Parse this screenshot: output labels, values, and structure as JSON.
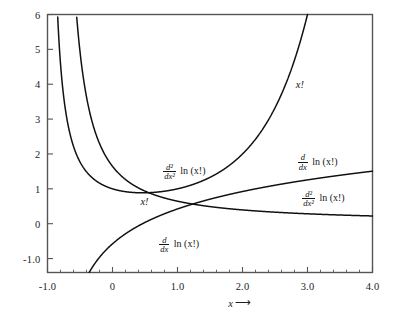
{
  "chart_data": {
    "type": "line",
    "title": "",
    "xlabel": "x",
    "ylabel": "",
    "xlim": [
      -1.0,
      4.0
    ],
    "ylim": [
      -1.4,
      6.0
    ],
    "grid": false,
    "legend_position": "inline-curve-labels",
    "x_ticks": [
      {
        "value": -1.0,
        "label": "-1.0"
      },
      {
        "value": 0.0,
        "label": "0"
      },
      {
        "value": 1.0,
        "label": "1.0"
      },
      {
        "value": 2.0,
        "label": "2.0"
      },
      {
        "value": 3.0,
        "label": "3.0"
      },
      {
        "value": 4.0,
        "label": "4.0"
      }
    ],
    "x_minor_ticks": [
      -0.8,
      -0.6,
      -0.4,
      -0.2,
      0.2,
      0.4,
      0.6,
      0.8,
      1.2,
      1.4,
      1.6,
      1.8,
      2.2,
      2.4,
      2.6,
      2.8,
      3.2,
      3.4,
      3.6,
      3.8
    ],
    "y_ticks": [
      {
        "value": 6,
        "label": "6"
      },
      {
        "value": 5,
        "label": "5"
      },
      {
        "value": 4,
        "label": "4"
      },
      {
        "value": 3,
        "label": "3"
      },
      {
        "value": 2,
        "label": "2"
      },
      {
        "value": 1,
        "label": "1"
      },
      {
        "value": 0,
        "label": "0"
      },
      {
        "value": -1.0,
        "label": "-1.0"
      }
    ],
    "series": [
      {
        "name": "x!",
        "function": "gamma(x+1)",
        "label": "x!",
        "points": [
          [
            -0.98,
            49.0
          ],
          [
            -0.95,
            19.5
          ],
          [
            -0.92,
            12.1
          ],
          [
            -0.9,
            9.51
          ],
          [
            -0.88,
            7.86
          ],
          [
            -0.86,
            6.69
          ],
          [
            -0.84,
            5.81
          ],
          [
            -0.82,
            5.13
          ],
          [
            -0.8,
            4.59
          ],
          [
            -0.78,
            4.15
          ],
          [
            -0.76,
            3.78
          ],
          [
            -0.74,
            3.47
          ],
          [
            -0.7,
            2.98
          ],
          [
            -0.65,
            2.53
          ],
          [
            -0.6,
            2.22
          ],
          [
            -0.55,
            1.98
          ],
          [
            -0.5,
            1.77
          ],
          [
            -0.45,
            1.62
          ],
          [
            -0.4,
            1.49
          ],
          [
            -0.35,
            1.38
          ],
          [
            -0.3,
            1.3
          ],
          [
            -0.25,
            1.23
          ],
          [
            -0.2,
            1.16
          ],
          [
            -0.15,
            1.11
          ],
          [
            -0.1,
            1.07
          ],
          [
            -0.05,
            1.03
          ],
          [
            0.0,
            1.0
          ],
          [
            0.1,
            0.951
          ],
          [
            0.2,
            0.918
          ],
          [
            0.3,
            0.898
          ],
          [
            0.4616,
            0.8856
          ],
          [
            0.6,
            0.894
          ],
          [
            0.8,
            0.931
          ],
          [
            1.0,
            1.0
          ],
          [
            1.2,
            1.102
          ],
          [
            1.4,
            1.242
          ],
          [
            1.6,
            1.429
          ],
          [
            1.8,
            1.676
          ],
          [
            2.0,
            2.0
          ],
          [
            2.2,
            2.424
          ],
          [
            2.4,
            2.981
          ],
          [
            2.6,
            3.717
          ],
          [
            2.8,
            4.694
          ],
          [
            3.0,
            6.0
          ]
        ]
      },
      {
        "name": "d/dx ln (x!)",
        "function": "digamma(x+1)",
        "label_left": "d/dx ln (x!)",
        "label_right": "d/dx ln (x!)",
        "points": [
          [
            -0.4,
            -1.4
          ],
          [
            -0.35,
            -1.0
          ],
          [
            -0.3,
            -0.695
          ],
          [
            -0.25,
            -0.455
          ],
          [
            -0.2,
            -0.258
          ],
          [
            -0.15,
            -0.094
          ],
          [
            -0.1,
            0.046
          ],
          [
            -0.05,
            0.166
          ],
          [
            0.0,
            0.2704
          ],
          [
            0.2,
            0.5838
          ],
          [
            0.4,
            0.7874
          ],
          [
            0.6,
            0.931
          ],
          [
            0.8,
            1.0391
          ],
          [
            1.0,
            1.1246
          ],
          [
            1.3,
            1.2222
          ],
          [
            1.6,
            1.3039
          ],
          [
            2.0,
            1.3956
          ],
          [
            2.5,
            1.4914
          ],
          [
            3.0,
            1.5689
          ],
          [
            3.5,
            1.6338
          ],
          [
            4.0,
            1.6895
          ]
        ]
      },
      {
        "name": "d2/dx2 ln (x!)",
        "function": "trigamma(x+1)",
        "label_left": "d²/dx² ln (x!)",
        "label_right": "d²/dx² ln (x!)",
        "points": [
          [
            -0.56,
            6.0
          ],
          [
            -0.5,
            4.93
          ],
          [
            -0.45,
            4.24
          ],
          [
            -0.4,
            3.7
          ],
          [
            -0.35,
            3.27
          ],
          [
            -0.3,
            2.92
          ],
          [
            -0.25,
            2.62
          ],
          [
            -0.2,
            2.37
          ],
          [
            -0.15,
            2.15
          ],
          [
            -0.1,
            1.97
          ],
          [
            -0.05,
            1.8
          ],
          [
            0.0,
            1.6449
          ],
          [
            0.2,
            1.2671
          ],
          [
            0.4,
            1.0256
          ],
          [
            0.6,
            0.8639
          ],
          [
            0.8,
            0.7494
          ],
          [
            1.0,
            0.6449
          ],
          [
            1.25,
            0.5645
          ],
          [
            1.5,
            0.4981
          ],
          [
            2.0,
            0.3949
          ],
          [
            2.5,
            0.3227
          ],
          [
            3.0,
            0.2838
          ],
          [
            3.5,
            0.2507
          ],
          [
            4.0,
            0.2213
          ]
        ]
      }
    ],
    "annotations": [
      {
        "id": "x-fact-upper",
        "text": "x!",
        "x": 2.82,
        "y": 3.97
      },
      {
        "id": "x-fact-lower",
        "text": "x!",
        "x": 0.43,
        "y": 0.63
      },
      {
        "id": "d2-upper",
        "numerator": "d²",
        "denominator": "dx²",
        "ln_text": "ln (x!)",
        "x": 0.78,
        "y": 1.47
      },
      {
        "id": "d1-lower",
        "numerator": "d",
        "denominator": "dx",
        "ln_text": "ln (x!)",
        "x": 0.72,
        "y": -0.62
      },
      {
        "id": "d1-right",
        "numerator": "d",
        "denominator": "dx",
        "ln_text": "ln (x!)",
        "x": 2.85,
        "y": 1.75
      },
      {
        "id": "d2-right",
        "numerator": "d²",
        "denominator": "dx²",
        "ln_text": "ln (x!)",
        "x": 2.92,
        "y": 0.7
      }
    ],
    "axis_arrow_label": {
      "symbol": "x",
      "arrow": "➝"
    },
    "colors": {
      "curve": "#111111",
      "axis": "#555555",
      "background": "#ffffff",
      "text": "#1a1a1a"
    }
  }
}
